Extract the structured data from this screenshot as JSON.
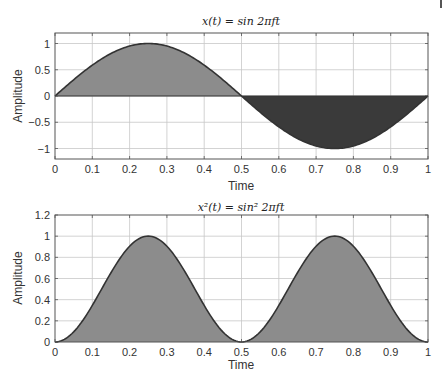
{
  "chart_data": [
    {
      "type": "area",
      "title": "x(t) = sin 2πft",
      "xlabel": "Time",
      "ylabel": "Amplitude",
      "xlim": [
        0,
        1
      ],
      "ylim": [
        -1.2,
        1.2
      ],
      "grid": true,
      "x_ticks": [
        "0",
        "0.1",
        "0.2",
        "0.3",
        "0.4",
        "0.5",
        "0.6",
        "0.7",
        "0.8",
        "0.9",
        "1"
      ],
      "y_ticks": [
        "1",
        "0.5",
        "0",
        "−0.5",
        "−1"
      ],
      "y_tick_values": [
        1,
        0.5,
        0,
        -0.5,
        -1
      ],
      "function": "sin(2*pi*t)",
      "x": [
        0,
        0.05,
        0.1,
        0.15,
        0.2,
        0.25,
        0.3,
        0.35,
        0.4,
        0.45,
        0.5,
        0.55,
        0.6,
        0.65,
        0.7,
        0.75,
        0.8,
        0.85,
        0.9,
        0.95,
        1.0
      ],
      "values": [
        0,
        0.309,
        0.588,
        0.809,
        0.951,
        1.0,
        0.951,
        0.809,
        0.588,
        0.309,
        0,
        -0.309,
        -0.588,
        -0.809,
        -0.951,
        -1.0,
        -0.951,
        -0.809,
        -0.588,
        -0.309,
        0
      ],
      "fill": {
        "positive": "#8c8c8c",
        "negative": "#3a3a3a"
      }
    },
    {
      "type": "area",
      "title": "x²(t) = sin² 2πft",
      "xlabel": "Time",
      "ylabel": "Amplitude",
      "xlim": [
        0,
        1
      ],
      "ylim": [
        0,
        1.2
      ],
      "grid": true,
      "x_ticks": [
        "0",
        "0.1",
        "0.2",
        "0.3",
        "0.4",
        "0.5",
        "0.6",
        "0.7",
        "0.8",
        "0.9",
        "1"
      ],
      "y_ticks": [
        "1.2",
        "1",
        "0.8",
        "0.6",
        "0.4",
        "0.2",
        "0"
      ],
      "y_tick_values": [
        1.2,
        1,
        0.8,
        0.6,
        0.4,
        0.2,
        0
      ],
      "function": "sin(2*pi*t)^2",
      "x": [
        0,
        0.05,
        0.1,
        0.15,
        0.2,
        0.25,
        0.3,
        0.35,
        0.4,
        0.45,
        0.5,
        0.55,
        0.6,
        0.65,
        0.7,
        0.75,
        0.8,
        0.85,
        0.9,
        0.95,
        1.0
      ],
      "values": [
        0,
        0.095,
        0.345,
        0.655,
        0.905,
        1.0,
        0.905,
        0.655,
        0.345,
        0.095,
        0,
        0.095,
        0.345,
        0.655,
        0.905,
        1.0,
        0.905,
        0.655,
        0.345,
        0.095,
        0
      ],
      "fill": {
        "positive": "#8c8c8c"
      }
    }
  ],
  "plots": {
    "top": {
      "title_main": "x(t) = sin 2πft",
      "xlabel": "Time",
      "ylabel": "Amplitude"
    },
    "bottom": {
      "title_main": "x²(t) = sin² 2πft",
      "xlabel": "Time",
      "ylabel": "Amplitude"
    }
  }
}
